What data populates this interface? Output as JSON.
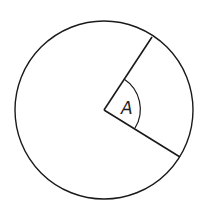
{
  "diagram": {
    "type": "circle-sector-angle",
    "angle_label": "A",
    "stroke_color": "#1a1a1a",
    "background": "#ffffff",
    "circle": {
      "cx": 104,
      "cy": 110,
      "r": 89
    },
    "center_point": {
      "x": 104,
      "y": 110
    },
    "radius_upper_end": {
      "x": 152,
      "y": 37
    },
    "radius_lower_end": {
      "x": 180,
      "y": 157
    },
    "angle_arc_radius": 36
  }
}
